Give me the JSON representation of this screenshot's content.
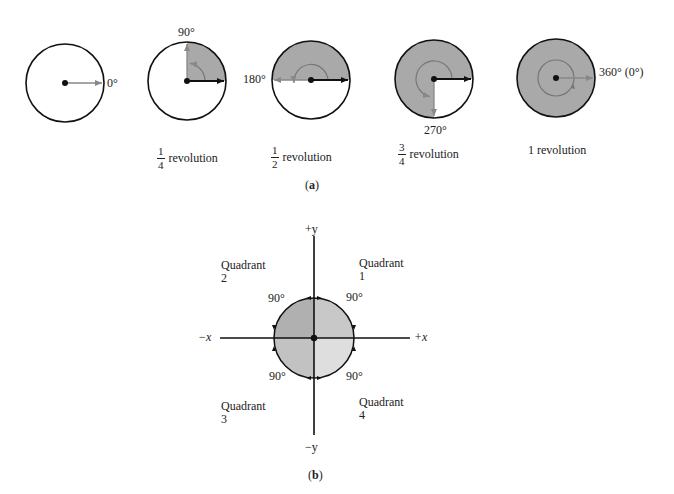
{
  "panel_a": {
    "label_open": "(",
    "label_letter": "a",
    "label_close": ")",
    "circles": [
      {
        "angle_label": "0°",
        "caption": ""
      },
      {
        "angle_label": "90°",
        "caption_num": "1",
        "caption_den": "4",
        "caption_text": "revolution"
      },
      {
        "angle_label": "180°",
        "caption_num": "1",
        "caption_den": "2",
        "caption_text": "revolution"
      },
      {
        "angle_label": "270°",
        "caption_num": "3",
        "caption_den": "4",
        "caption_text": "revolution"
      },
      {
        "angle_label": "360° (0°)",
        "caption_text": "1 revolution"
      }
    ]
  },
  "panel_b": {
    "label_open": "(",
    "label_letter": "b",
    "label_close": ")",
    "axes": {
      "pos_y": "+y",
      "neg_y": "−y",
      "pos_x": "+x",
      "neg_x": "−x"
    },
    "quadrants": [
      {
        "name": "Quadrant",
        "number": "1",
        "angle": "90°"
      },
      {
        "name": "Quadrant",
        "number": "2",
        "angle": "90°"
      },
      {
        "name": "Quadrant",
        "number": "3",
        "angle": "90°"
      },
      {
        "name": "Quadrant",
        "number": "4",
        "angle": "90°"
      }
    ]
  },
  "colors": {
    "shade": "#a9a9a9",
    "q1": "#c8c8c8",
    "q2": "#b0b0b0",
    "q3": "#c2c2c2",
    "q4": "#dedede",
    "ray_gray": "#8a8a8a",
    "ink": "#111111"
  }
}
